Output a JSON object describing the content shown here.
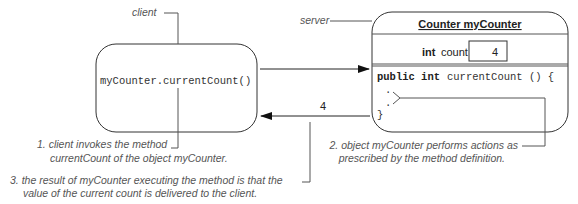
{
  "client": {
    "label": "client",
    "call_text": "myCounter.currentCount()"
  },
  "server": {
    "label": "server",
    "object_title": "Counter myCounter",
    "field_type": "int",
    "field_name": "count",
    "field_value": "4",
    "method_keywords": "public int",
    "method_signature": "currentCount () {",
    "body_dots": [
      ".",
      "."
    ],
    "closing_brace": "}"
  },
  "return_value": "4",
  "annotations": {
    "step1_line1": "1. client invokes the method",
    "step1_line2": "currentCount of the object myCounter.",
    "step2_line1": "2. object myCounter performs actions as",
    "step2_line2": "prescribed by the method definition.",
    "step3_line1": "3. the result of myCounter executing the method is that the",
    "step3_line2": "value of the current count is delivered to the client."
  }
}
